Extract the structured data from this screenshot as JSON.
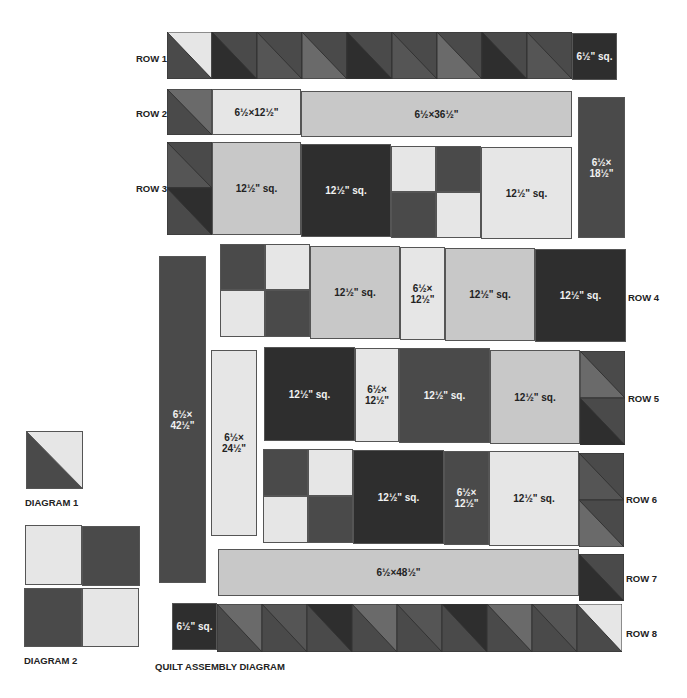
{
  "title": "QUILT ASSEMBLY DIAGRAM",
  "colors": {
    "light": "#e6e6e6",
    "medium": "#c8c8c8",
    "dark": "#4a4a4a",
    "extra_dark": "#2e2e2e",
    "gray": "#6a6a6a"
  },
  "rows": {
    "r1": {
      "label": "ROW 1",
      "end_block": "6½\" sq."
    },
    "r2": {
      "label": "ROW 2",
      "b1": "6½×12½\"",
      "b2": "6½×36½\""
    },
    "r3": {
      "label": "ROW 3",
      "b1": "12½\" sq.",
      "b2": "12½\" sq.",
      "b3": "12½\" sq."
    },
    "r4": {
      "label": "ROW 4",
      "b1": "12½\" sq.",
      "b2": "6½×\n12½\"",
      "b3": "12½\" sq.",
      "b4": "12½\" sq."
    },
    "r5": {
      "label": "ROW 5",
      "b1": "12½\" sq.",
      "b2": "6½×\n12½\"",
      "b3": "12½\" sq.",
      "b4": "12½\" sq."
    },
    "r6": {
      "label": "ROW 6",
      "b1": "12½\" sq.",
      "b2": "6½×\n12½\"",
      "b3": "12½\" sq."
    },
    "r7": {
      "label": "ROW 7",
      "b1": "6½×48½\""
    },
    "r8": {
      "label": "ROW 8",
      "start_block": "6½\" sq."
    }
  },
  "strips": {
    "right_top": "6½×\n18½\"",
    "left_long": "6½×\n42½\"",
    "left_mid": "6½×\n24½\""
  },
  "diagrams": {
    "d1": "DIAGRAM 1",
    "d2": "DIAGRAM 2"
  }
}
